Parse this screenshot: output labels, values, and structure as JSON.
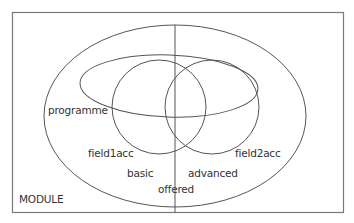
{
  "diagram": {
    "type": "venn-diagram",
    "colors": {
      "stroke": "#555555",
      "frame": "#777777",
      "text": "#333333",
      "background": "#ffffff"
    },
    "frame_label": "MODULE",
    "sets": [
      {
        "id": "offered",
        "label": "offered",
        "shape": "ellipse"
      },
      {
        "id": "programme",
        "label": "programme",
        "shape": "ellipse"
      },
      {
        "id": "field1acc",
        "label": "field1acc",
        "shape": "circle"
      },
      {
        "id": "field2acc",
        "label": "field2acc",
        "shape": "circle"
      }
    ],
    "partition": {
      "divider": "vertical-line",
      "left_label": "basic",
      "right_label": "advanced"
    }
  }
}
